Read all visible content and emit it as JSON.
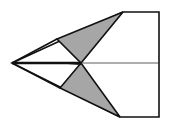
{
  "diagram": {
    "colors": {
      "background": "#ffffff",
      "stroke": "#111111",
      "shaded_fold": "#a6a6a6",
      "paper": "#ffffff"
    },
    "points": {
      "nose": [
        12,
        63
      ],
      "top_left_edge": [
        123,
        12
      ],
      "top_right": [
        159,
        12
      ],
      "bottom_right": [
        159,
        117
      ],
      "bottom_left_edge": [
        120,
        117
      ],
      "center": [
        81,
        63
      ],
      "top_fold": [
        57,
        39
      ],
      "bottom_fold": [
        60,
        88
      ],
      "right_mid": [
        159,
        63
      ]
    }
  }
}
